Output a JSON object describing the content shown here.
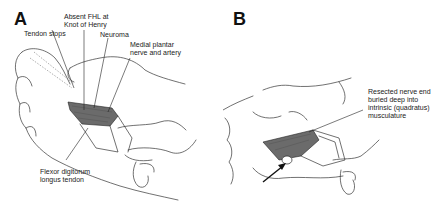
{
  "figure": {
    "panels": [
      {
        "id": "A",
        "letter": "A",
        "labels": [
          {
            "key": "tendon_stops",
            "text": "Tendon stops"
          },
          {
            "key": "absent_fhl",
            "text": "Absent FHL at\nKnot of Henry"
          },
          {
            "key": "neuroma",
            "text": "Neuroma"
          },
          {
            "key": "medial_plantar",
            "text": "Medial plantar\nnerve and artery"
          },
          {
            "key": "fdl_tendon",
            "text": "Flexor digitorum\nlongus tendon"
          }
        ]
      },
      {
        "id": "B",
        "letter": "B",
        "labels": [
          {
            "key": "resected_nerve",
            "text": "Resected nerve end\nburied deep into\nintrinsic (quadratus)\nmusculature"
          }
        ],
        "arrow": "arrow-pointing-to-buried-nerve-end"
      }
    ]
  }
}
